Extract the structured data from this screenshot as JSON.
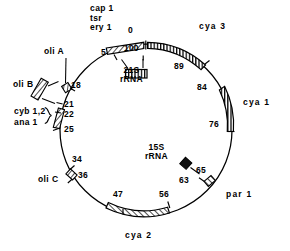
{
  "figure": {
    "circle": {
      "cx": 146,
      "cy": 130,
      "r": 86
    },
    "stroke_color": "#000000",
    "background": "#ffffff"
  },
  "labels": {
    "cap1": "cap 1",
    "tsr": "tsr",
    "ery1": "ery 1",
    "zero": "0",
    "hundred": "100",
    "five": "5",
    "cya3": "cya 3",
    "n89": "89",
    "n84": "84",
    "cya1": "cya 1",
    "n76": "76",
    "n65": "65",
    "n63": "63",
    "par1": "par 1",
    "n56": "56",
    "n47": "47",
    "cya2": "cya 2",
    "n36": "36",
    "n34": "34",
    "oliC": "oli C",
    "n25": "25",
    "n22": "22",
    "n21": "21",
    "cyb12": "cyb 1,2",
    "ana1": "ana 1",
    "oliB": "oli B",
    "n18": "18",
    "oliA": "oli A",
    "rrna21S_line1": "21S",
    "rrna21S_line2": "rRNA",
    "rrna15S_line1": "15S",
    "rrna15S_line2": "rRNA",
    "brace": "}"
  },
  "map_features": [
    {
      "name": "ery1-cap1-tsr-segment",
      "type": "hatched-arc",
      "start_unit": 96.0,
      "end_unit": 100.0,
      "genes": [
        "cap 1",
        "tsr",
        "ery 1"
      ]
    },
    {
      "name": "cya3-segment",
      "type": "hatched-arc",
      "start_unit": 0.0,
      "end_unit": 11.0,
      "genes": [
        "cya 3"
      ]
    },
    {
      "name": "cya1-segment",
      "type": "hatched-arc",
      "start_unit": 16.0,
      "end_unit": 24.0,
      "genes": [
        "cya 1"
      ]
    },
    {
      "name": "par1-box",
      "type": "small-box",
      "start_unit": 36.0,
      "end_unit": 38.0,
      "genes": [
        "par 1"
      ]
    },
    {
      "name": "cya2-segment",
      "type": "hatched-arc",
      "start_unit": 44.0,
      "end_unit": 53.0,
      "genes": [
        "cya 2"
      ]
    },
    {
      "name": "oliC-box",
      "type": "small-box",
      "start_unit": 64.0,
      "end_unit": 66.0,
      "genes": [
        "oli C"
      ]
    },
    {
      "name": "cyb-ana-box",
      "type": "small-box",
      "start_unit": 75.0,
      "end_unit": 78.0,
      "genes": [
        "cyb 1,2",
        "ana 1"
      ]
    },
    {
      "name": "oliA-box",
      "type": "small-box",
      "start_unit": 82.0,
      "end_unit": 83.0,
      "genes": [
        "oli A"
      ]
    },
    {
      "name": "oliB-box",
      "type": "detached-box",
      "genes": [
        "oli B"
      ]
    },
    {
      "name": "rrna-21S-box",
      "type": "inner-hatched-box",
      "genes": [
        "21S rRNA"
      ]
    },
    {
      "name": "rrna-15S-box",
      "type": "inner-filled-box",
      "genes": [
        "15S rRNA"
      ]
    }
  ],
  "tick_marks": [
    "0",
    "5",
    "18",
    "21",
    "22",
    "25",
    "34",
    "36",
    "47",
    "56",
    "63",
    "65",
    "76",
    "84",
    "89",
    "100"
  ]
}
